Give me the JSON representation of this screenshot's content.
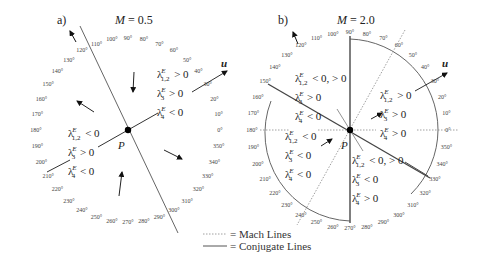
{
  "panels": [
    {
      "id": "a",
      "label": "a)",
      "title": "M = 0.5",
      "title_var": "M",
      "title_val": "= 0.5",
      "center": [
        128,
        130
      ],
      "point_label": "P",
      "flow_label": "u",
      "angle_radius": 92,
      "regions": [
        {
          "l12": "> 0",
          "l3": "> 0",
          "l4": "< 0"
        },
        {
          "l12": "< 0",
          "l3": "> 0",
          "l4": "< 0"
        }
      ]
    },
    {
      "id": "b",
      "label": "b)",
      "title": "M = 2.0",
      "title_var": "M",
      "title_val": "= 2.0",
      "center": [
        350,
        130
      ],
      "point_label": "P",
      "flow_label": "u",
      "angle_radius": 98,
      "regions": [
        {
          "l12": "< 0, > 0",
          "l3": "> 0",
          "l4": "< 0"
        },
        {
          "l12": "> 0",
          "l3": "> 0",
          "l4": "> 0"
        },
        {
          "l12": "< 0",
          "l3": "< 0",
          "l4": "< 0"
        },
        {
          "l12": "< 0, > 0",
          "l3": "< 0",
          "l4": "> 0"
        }
      ]
    }
  ],
  "angles": [
    "0°",
    "10°",
    "20°",
    "30°",
    "40°",
    "50°",
    "60°",
    "70°",
    "80°",
    "90°",
    "100°",
    "110°",
    "120°",
    "130°",
    "140°",
    "150°",
    "160°",
    "170°",
    "180°",
    "190°",
    "200°",
    "210°",
    "220°",
    "230°",
    "240°",
    "250°",
    "260°",
    "270°",
    "280°",
    "290°",
    "300°",
    "310°",
    "320°",
    "330°",
    "340°",
    "350°"
  ],
  "symbols": {
    "lambda": "λ",
    "sup": "E",
    "sub12": "1,2",
    "sub3": "3",
    "sub4": "4"
  },
  "legend": {
    "mach": "= Mach Lines",
    "conjugate": "= Conjugate Lines"
  },
  "colors": {
    "line": "#555555",
    "text": "#222222",
    "dot": "#000000"
  }
}
